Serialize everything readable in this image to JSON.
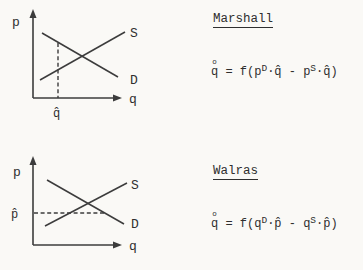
{
  "page": {
    "paper_color": "#faf9f6",
    "ink_color": "#2f2f2f"
  },
  "diagrams": [
    {
      "y_axis_label": "p",
      "x_axis_label": "q",
      "supply_label": "S",
      "demand_label": "D",
      "marker_label": "q̂"
    },
    {
      "y_axis_label": "p",
      "x_axis_label": "q",
      "supply_label": "S",
      "demand_label": "D",
      "marker_label": "p̂"
    }
  ],
  "sections": [
    {
      "title": "Marshall",
      "equation": {
        "lhs_ring": "o",
        "lhs_base": "q",
        "mid": " = f(",
        "t1_base": "p",
        "t1_sup": "D",
        "t1_tail": "·q̂ - ",
        "t2_base": "p",
        "t2_sup": "S",
        "t2_tail": "·q̂)"
      }
    },
    {
      "title": "Walras",
      "equation": {
        "lhs_ring": "o",
        "lhs_base": "q",
        "mid": " = f(",
        "t1_base": "q",
        "t1_sup": "D",
        "t1_tail": "·p̂ - ",
        "t2_base": "q",
        "t2_sup": "S",
        "t2_tail": "·p̂)"
      }
    }
  ]
}
